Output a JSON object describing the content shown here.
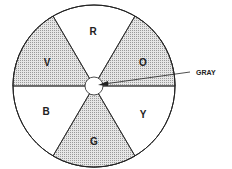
{
  "diagram": {
    "type": "color-wheel",
    "segments": [
      {
        "label": "R",
        "shaded": false
      },
      {
        "label": "O",
        "shaded": true
      },
      {
        "label": "Y",
        "shaded": false
      },
      {
        "label": "G",
        "shaded": true
      },
      {
        "label": "B",
        "shaded": false
      },
      {
        "label": "V",
        "shaded": true
      }
    ],
    "center_label": "GRAY",
    "colors": {
      "stroke": "#222222",
      "shade": "#d8d8d8",
      "background": "#ffffff"
    }
  }
}
